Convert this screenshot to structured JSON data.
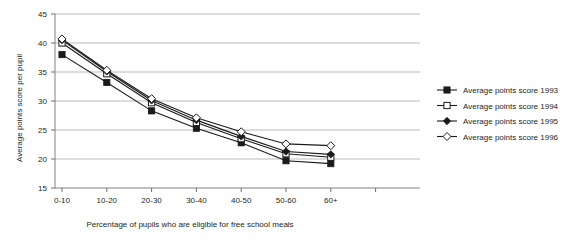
{
  "chart_data": {
    "type": "line",
    "title": "",
    "xlabel": "Percentage of pupils who are eligible for free school meals",
    "ylabel": "Average points score per pupil",
    "categories": [
      "0-10",
      "10-20",
      "20-30",
      "30-40",
      "40-50",
      "50-60",
      "60+"
    ],
    "ylim": [
      15,
      45
    ],
    "yticks": [
      15,
      20,
      25,
      30,
      35,
      40,
      45
    ],
    "ytick_labels": [
      "15",
      "20",
      "25",
      "30",
      "35",
      "40",
      "45"
    ],
    "grid": "horizontal",
    "legend_position": "right",
    "series": [
      {
        "name": "Average points score 1993",
        "marker": "filled-square",
        "color": "#1a1a1a",
        "values": [
          38.0,
          33.2,
          28.3,
          25.3,
          22.8,
          19.7,
          19.2
        ]
      },
      {
        "name": "Average points score 1994",
        "marker": "open-square",
        "color": "#1a1a1a",
        "values": [
          40.0,
          34.7,
          29.7,
          26.3,
          23.5,
          20.9,
          20.3
        ]
      },
      {
        "name": "Average points score 1995",
        "marker": "filled-diamond",
        "color": "#1a1a1a",
        "values": [
          40.5,
          35.1,
          30.1,
          26.7,
          23.9,
          21.3,
          20.8
        ]
      },
      {
        "name": "Average points score 1996",
        "marker": "open-diamond",
        "color": "#1a1a1a",
        "values": [
          40.7,
          35.3,
          30.4,
          27.1,
          24.7,
          22.6,
          22.3
        ]
      }
    ]
  },
  "axes": {
    "y_title": "Average points score per pupil",
    "x_title": "Percentage of pupils who are eligible for free school meals"
  },
  "legend": {
    "entries": [
      {
        "label": "Average points score 1993"
      },
      {
        "label": "Average points score 1994"
      },
      {
        "label": "Average points score 1995"
      },
      {
        "label": "Average points score 1996"
      }
    ]
  },
  "style": {
    "line_color": "#1a1a1a",
    "grid_color": "#a7a9ac",
    "axis_color": "#6d6e71",
    "background": "#ffffff"
  }
}
